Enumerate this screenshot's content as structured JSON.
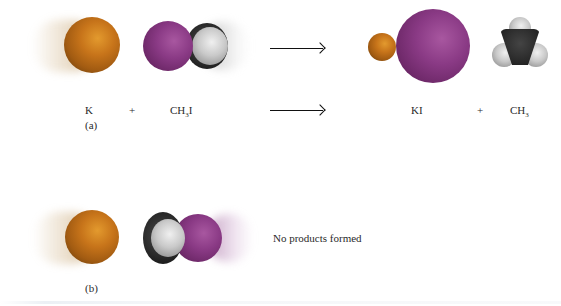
{
  "panel_a": {
    "reactant_1": "K",
    "plus_left": "+",
    "reactant_2_main": "CH",
    "reactant_2_sub": "3",
    "reactant_2_tail": "I",
    "panel_label": "(a)",
    "product_1": "KI",
    "plus_right": "+",
    "product_2_main": "CH",
    "product_2_sub": "3"
  },
  "panel_b": {
    "outcome": "No products formed",
    "panel_label": "(b)"
  },
  "colors": {
    "potassium": "#c7741a",
    "iodine": "#8a3a85",
    "hydrogen": "#c9c9c9",
    "carbon": "#2a2a2a",
    "arrow": "#111111"
  }
}
